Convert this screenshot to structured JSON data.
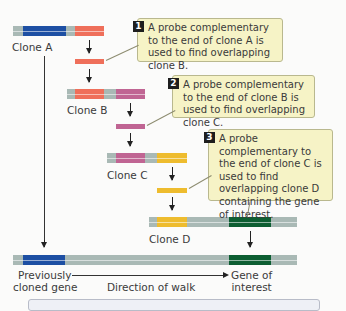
{
  "diagram": {
    "clones": [
      {
        "label": "Clone A"
      },
      {
        "label": "Clone B"
      },
      {
        "label": "Clone C"
      },
      {
        "label": "Clone D"
      }
    ],
    "callouts": [
      {
        "number": "1",
        "text": "A probe complementary to the end of clone A is used to find overlapping clone B."
      },
      {
        "number": "2",
        "text": "A probe complementary to the end of clone B is used to find overlapping clone C."
      },
      {
        "number": "3",
        "text": "A probe complementary to the end of clone C is used to find overlapping clone D containing the gene of interest."
      }
    ],
    "bottom": {
      "left_label_line1": "Previously",
      "left_label_line2": "cloned gene",
      "middle_label": "Direction of walk",
      "right_label_line1": "Gene of",
      "right_label_line2": "interest"
    },
    "colors": {
      "vector_gray": "#a9b9b5",
      "previous_gene_blue": "#1d4fa3",
      "probe_a_salmon": "#ef6f5a",
      "probe_b_pink": "#c06593",
      "probe_c_yellow": "#eebc2e",
      "gene_of_interest_green": "#0d5e32",
      "callout_bg": "#f6f3c6"
    }
  }
}
